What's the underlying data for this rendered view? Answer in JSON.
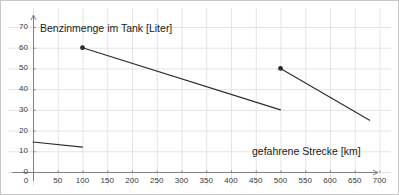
{
  "chart_data": {
    "type": "line",
    "title": "",
    "xlabel": "gefahrene Strecke [km]",
    "ylabel": "Benzinmenge im Tank [Liter]",
    "xlim": [
      0,
      730
    ],
    "ylim": [
      0,
      74
    ],
    "grid": true,
    "legend": "none",
    "xticks": [
      0,
      50,
      100,
      150,
      200,
      250,
      300,
      350,
      400,
      450,
      500,
      550,
      600,
      650,
      700
    ],
    "yticks": [
      0,
      10,
      20,
      30,
      40,
      50,
      60,
      70
    ],
    "xtick_labels": [
      "0",
      "50",
      "100",
      "150",
      "200",
      "250",
      "300",
      "350",
      "400",
      "450",
      "500",
      "550",
      "600",
      "650",
      "700"
    ],
    "ytick_labels": [
      "0",
      "10",
      "20",
      "30",
      "40",
      "50",
      "60",
      "70"
    ],
    "series": [
      {
        "name": "Anfahrt (Rest im Tank)",
        "marker": "none",
        "x": [
          0,
          100
        ],
        "y": [
          14.5,
          12
        ]
      },
      {
        "name": "Fahrt nach erstem Tanken",
        "marker": "start-dot",
        "x": [
          100,
          500
        ],
        "y": [
          60,
          30
        ]
      },
      {
        "name": "Fahrt nach zweitem Tanken",
        "marker": "start-dot",
        "x": [
          500,
          680
        ],
        "y": [
          50,
          25
        ]
      }
    ],
    "markers": [
      {
        "x": 100,
        "y": 60
      },
      {
        "x": 500,
        "y": 50
      }
    ],
    "colors": {
      "line": "#2b2b2b",
      "axis": "#808080",
      "grid": "#e4e4e4",
      "border": "#c8c8c8",
      "tick_text": "#3a3a3a",
      "title_text": "#1c1c1c",
      "background": "#ffffff"
    }
  }
}
